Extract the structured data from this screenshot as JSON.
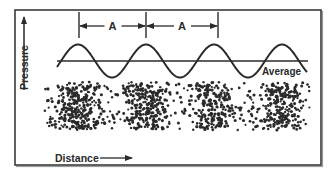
{
  "diagram": {
    "frame": {
      "x": 15,
      "y": 10,
      "width": 306,
      "height": 155,
      "stroke": "#3a3a3a"
    },
    "colors": {
      "ink": "#2a2a2a",
      "background": "#ffffff",
      "frame_shadow": "#9a9a9a"
    },
    "axes": {
      "y_label": "Pressure",
      "x_label": "Distance"
    },
    "wave": {
      "label_average": "Average",
      "baseline_y": 61,
      "amplitude": 16.5,
      "x_start": 57,
      "x_end": 308,
      "wavelength": 68,
      "peaks_x": [
        78,
        146,
        214,
        282
      ]
    },
    "wavelength_markers": {
      "label": "A",
      "marker_x": [
        79,
        146,
        218
      ],
      "spans": [
        {
          "label": "A",
          "from": 79,
          "to": 146
        },
        {
          "label": "A",
          "from": 146,
          "to": 218
        }
      ]
    },
    "particles": {
      "band": {
        "x_start": 40,
        "x_end": 310,
        "y_top": 82,
        "y_bottom": 130
      },
      "compression_centers_x": [
        78,
        146,
        214,
        282
      ],
      "dot_radius": 1.35,
      "description": "Air particles: dense compressions under wave peaks, sparse rarefactions under troughs"
    }
  }
}
